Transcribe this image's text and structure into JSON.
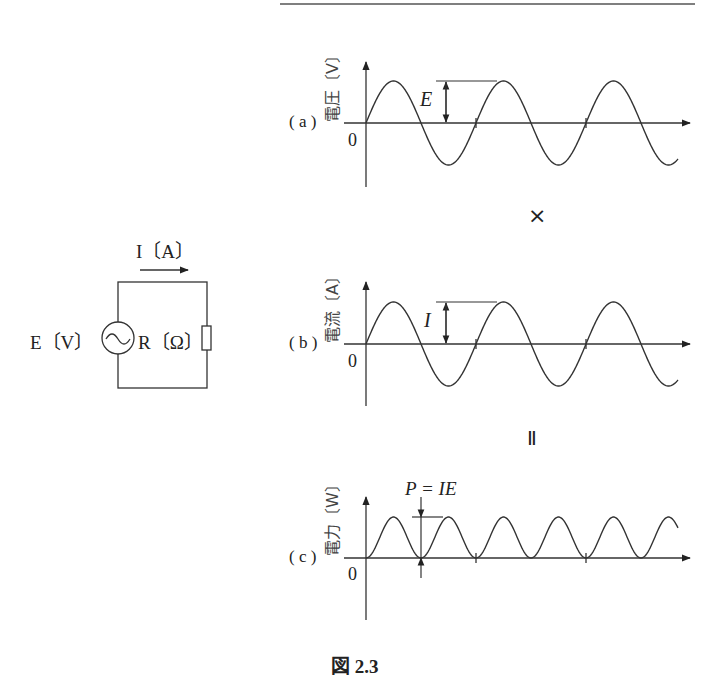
{
  "figure": {
    "caption": "図 2.3",
    "operators": {
      "times": "×",
      "equals": "Ⅱ"
    }
  },
  "circuit": {
    "current_label": "I〔A〕",
    "source_label": "E〔V〕",
    "resistor_label": "R〔Ω〕"
  },
  "plots": [
    {
      "id": "a",
      "panel_label": "( a )",
      "ylabel": "電圧〔V〕",
      "origin": "0",
      "amplitude_label": "E"
    },
    {
      "id": "b",
      "panel_label": "( b )",
      "ylabel": "電流〔A〕",
      "origin": "0",
      "amplitude_label": "I"
    },
    {
      "id": "c",
      "panel_label": "( c )",
      "ylabel": "電力〔W〕",
      "origin": "0",
      "amplitude_label": "P = IE"
    }
  ],
  "chart_data": [
    {
      "type": "line",
      "title": "(a) 電圧",
      "ylabel": "電圧〔V〕",
      "xlabel": "",
      "series": [
        {
          "name": "voltage",
          "function": "E·sin(ωt)",
          "cycles": 2.8
        }
      ]
    },
    {
      "type": "line",
      "title": "(b) 電流",
      "ylabel": "電流〔A〕",
      "xlabel": "",
      "series": [
        {
          "name": "current",
          "function": "I·sin(ωt)",
          "cycles": 2.8
        }
      ]
    },
    {
      "type": "line",
      "title": "(c) 電力",
      "ylabel": "電力〔W〕",
      "xlabel": "",
      "series": [
        {
          "name": "power",
          "function": "IE·sin²(ωt)",
          "cycles": 5.6
        }
      ]
    }
  ]
}
